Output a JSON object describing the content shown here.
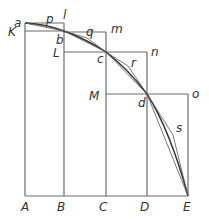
{
  "diagram": {
    "colors": {
      "frame": "#6a6a6a",
      "curve": "#333333",
      "polygon": "#555555",
      "label": "#333333",
      "background": "#ffffff"
    },
    "baseline_labels": [
      {
        "text": "A",
        "x": 21,
        "y": 211
      },
      {
        "text": "B",
        "x": 57,
        "y": 211
      },
      {
        "text": "C",
        "x": 99,
        "y": 211
      },
      {
        "text": "D",
        "x": 140,
        "y": 211
      },
      {
        "text": "E",
        "x": 183,
        "y": 211
      }
    ],
    "point_labels": [
      {
        "text": "a",
        "x": 14,
        "y": 27
      },
      {
        "text": "p",
        "x": 46,
        "y": 23
      },
      {
        "text": "l",
        "x": 63,
        "y": 19
      },
      {
        "text": "K",
        "x": 8,
        "y": 36
      },
      {
        "text": "b",
        "x": 56,
        "y": 44
      },
      {
        "text": "q",
        "x": 86,
        "y": 36
      },
      {
        "text": "m",
        "x": 111,
        "y": 33
      },
      {
        "text": "L",
        "x": 53,
        "y": 57
      },
      {
        "text": "c",
        "x": 97,
        "y": 63
      },
      {
        "text": "n",
        "x": 151,
        "y": 56
      },
      {
        "text": "r",
        "x": 131,
        "y": 67
      },
      {
        "text": "M",
        "x": 89,
        "y": 100
      },
      {
        "text": "d",
        "x": 138,
        "y": 107
      },
      {
        "text": "o",
        "x": 192,
        "y": 98
      },
      {
        "text": "s",
        "x": 176,
        "y": 132
      }
    ],
    "points": {
      "a": [
        25,
        23
      ],
      "b": [
        64,
        31
      ],
      "c": [
        106,
        52
      ],
      "d": [
        147,
        94
      ],
      "E": [
        188,
        196
      ],
      "p": [
        46,
        26
      ],
      "q": [
        87,
        38
      ],
      "r": [
        128,
        66
      ],
      "s": [
        173,
        135
      ]
    }
  }
}
